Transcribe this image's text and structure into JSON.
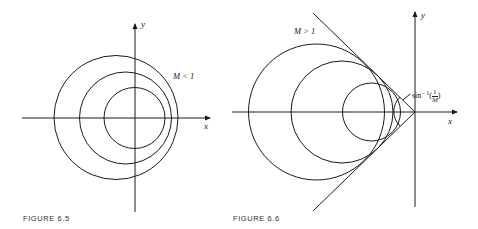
{
  "figures": [
    {
      "caption": "FIGURE  6.5",
      "x_label": "x",
      "y_label": "y",
      "region_label": "M < 1"
    },
    {
      "caption": "FIGURE  6.6",
      "x_label": "x",
      "y_label": "y",
      "region_label": "M > 1",
      "angle_label_func": "sin",
      "angle_label_exp": "− 1",
      "angle_label_num": "1",
      "angle_label_den": "M"
    }
  ],
  "colors": {
    "stroke": "#1a1a1a",
    "background": "#ffffff"
  }
}
